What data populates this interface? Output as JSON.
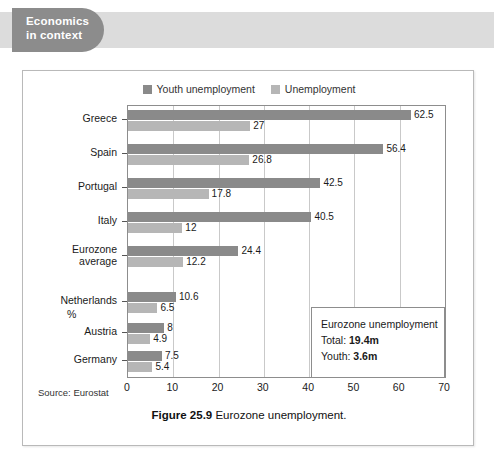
{
  "section_tab": {
    "line1": "Economics",
    "line2": "in context"
  },
  "figure": {
    "caption_number": "Figure 25.9",
    "caption_text": "Eurozone unemployment.",
    "source": "Source: Eurostat",
    "axis_unit_label": "%"
  },
  "annotation": {
    "title": "Eurozone unemployment",
    "total_label": "Total:",
    "total_value": "19.4m",
    "youth_label": "Youth:",
    "youth_value": "3.6m"
  },
  "colors": {
    "youth_bar": "#8a8a8a",
    "unemployment_bar": "#b6b6b6",
    "tab_background": "#8c8c8c",
    "band_background": "#dcdcdc",
    "axis": "#8d8d8d",
    "gridline": "#c9c9c9"
  },
  "chart_data": {
    "type": "bar",
    "orientation": "horizontal",
    "title": "Eurozone unemployment",
    "xlabel": "%",
    "ylabel": "",
    "xlim": [
      0,
      70
    ],
    "xticks": [
      0,
      10,
      20,
      30,
      40,
      50,
      60,
      70
    ],
    "grid": true,
    "legend_position": "top-center",
    "categories": [
      "Greece",
      "Spain",
      "Portugal",
      "Italy",
      "Eurozone average",
      "Netherlands",
      "Austria",
      "Germany"
    ],
    "series": [
      {
        "name": "Youth unemployment",
        "color": "#8a8a8a",
        "values": [
          62.5,
          56.4,
          42.5,
          40.5,
          24.4,
          10.6,
          8,
          7.5
        ],
        "labels": [
          "62.5",
          "56.4",
          "42.5",
          "40.5",
          "24.4",
          "10.6",
          "8",
          "7.5"
        ]
      },
      {
        "name": "Unemployment",
        "color": "#b6b6b6",
        "values": [
          27,
          26.8,
          17.8,
          12,
          12.2,
          6.5,
          4.9,
          5.4
        ],
        "labels": [
          "27",
          "26.8",
          "17.8",
          "12",
          "12.2",
          "6.5",
          "4.9",
          "5.4"
        ]
      }
    ]
  }
}
